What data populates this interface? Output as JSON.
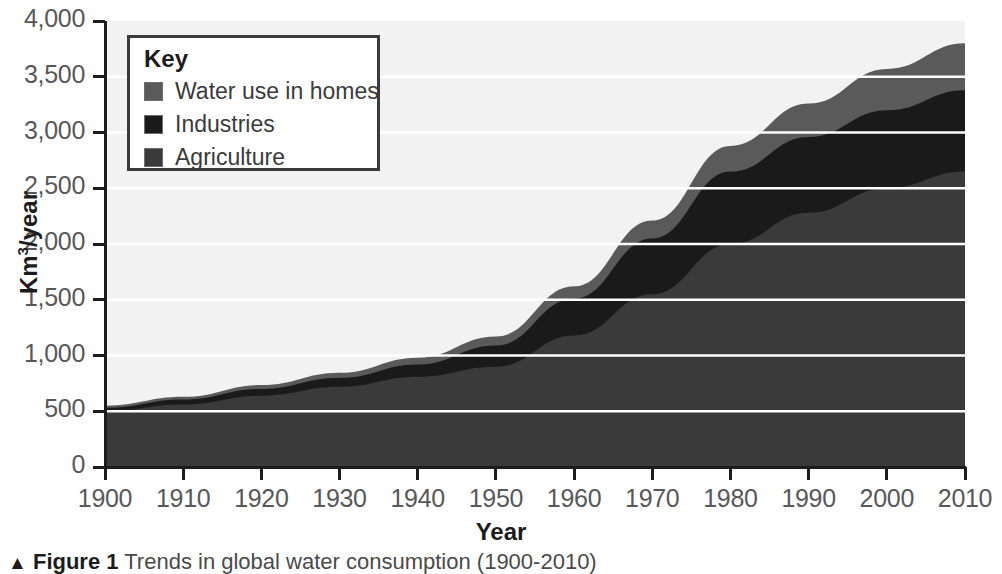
{
  "figure": {
    "caption_arrow": "▲",
    "caption_figure_number": "Figure 1",
    "caption_text": "Trends in global water consumption (1900-2010)"
  },
  "legend": {
    "title": "Key",
    "items": [
      {
        "label": "Water use in homes",
        "color": "#5a5a5a"
      },
      {
        "label": "Industries",
        "color": "#1a1a1a"
      },
      {
        "label": "Agriculture",
        "color": "#3a3a3a"
      }
    ]
  },
  "axes": {
    "y_title_main": "Km",
    "y_title_sup": "3",
    "y_title_tail": "/year",
    "x_title": "Year",
    "y_ticks": [
      "0",
      "500",
      "1,000",
      "1,500",
      "2,000",
      "2,500",
      "3,000",
      "3,500",
      "4,000"
    ],
    "x_ticks": [
      "1900",
      "1910",
      "1920",
      "1930",
      "1940",
      "1950",
      "1960",
      "1970",
      "1980",
      "1990",
      "2000",
      "2010"
    ]
  },
  "chart_data": {
    "type": "area",
    "stacked": true,
    "title": "Trends in global water consumption (1900-2010)",
    "xlabel": "Year",
    "ylabel": "Km3/year",
    "xlim": [
      1900,
      2010
    ],
    "ylim": [
      0,
      4000
    ],
    "grid": true,
    "grid_color": "#ffffff",
    "grid_axis": "y",
    "grid_step": 500,
    "legend_position": "top-left-inside",
    "plot_background": "#f2f2f2",
    "x": [
      1900,
      1910,
      1920,
      1930,
      1940,
      1950,
      1960,
      1970,
      1980,
      1990,
      2000,
      2010
    ],
    "series": [
      {
        "name": "Agriculture",
        "color": "#3a3a3a",
        "values": [
          500,
          560,
          640,
          720,
          810,
          900,
          1180,
          1550,
          2000,
          2280,
          2500,
          2650
        ]
      },
      {
        "name": "Industries",
        "color": "#1a1a1a",
        "values": [
          30,
          45,
          60,
          80,
          110,
          190,
          330,
          500,
          650,
          680,
          700,
          730
        ]
      },
      {
        "name": "Water use in homes",
        "color": "#5a5a5a",
        "values": [
          20,
          25,
          35,
          45,
          60,
          80,
          110,
          160,
          230,
          300,
          370,
          420
        ]
      }
    ],
    "totals": [
      550,
      630,
      735,
      845,
      980,
      1170,
      1620,
      2210,
      2880,
      3260,
      3570,
      3800
    ]
  }
}
